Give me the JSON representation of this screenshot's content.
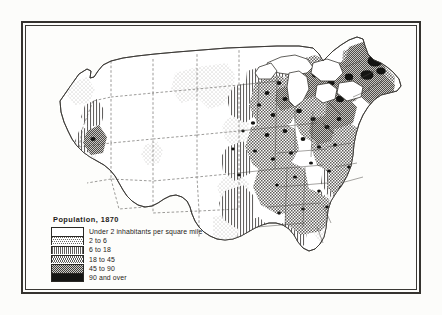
{
  "figure": {
    "kind": "historical-choropleth-map",
    "year": "1870"
  },
  "legend": {
    "title": "Population, 1870",
    "entries": [
      {
        "label": "Under 2 inhabitants per square mile",
        "pattern": "blank-white",
        "color": "#ffffff",
        "min": 0,
        "max": 2
      },
      {
        "label": "2 to 6",
        "pattern": "light-stipple",
        "color": "#ededea",
        "min": 2,
        "max": 6
      },
      {
        "label": "6 to 18",
        "pattern": "vertical-lines",
        "color": "#d8d8d5",
        "min": 6,
        "max": 18
      },
      {
        "label": "18 to 45",
        "pattern": "checker-hatch",
        "color": "#b4b4b1",
        "min": 18,
        "max": 45
      },
      {
        "label": "45 to 90",
        "pattern": "dense-checker",
        "color": "#83837f",
        "min": 45,
        "max": 90
      },
      {
        "label": "90 and over",
        "pattern": "solid-black",
        "color": "#151513",
        "min": 90,
        "max": null
      }
    ]
  },
  "colors": {
    "paper": "#fdfdfb",
    "ink": "#2a2824",
    "frame": "#35332f",
    "coastline": "#3a3834",
    "state_border": "#4a4844"
  },
  "chart_data": {
    "type": "heatmap",
    "title": "Population, 1870",
    "xlabel": "",
    "ylabel": "",
    "units": "inhabitants per square mile",
    "class_breaks": [
      0,
      2,
      6,
      18,
      45,
      90
    ],
    "class_labels": [
      "Under 2 inhabitants per square mile",
      "2 to 6",
      "6 to 18",
      "18 to 45",
      "45 to 90",
      "90 and over"
    ],
    "regions": [
      {
        "name": "Massachusetts / Boston",
        "class": 5
      },
      {
        "name": "New York City area",
        "class": 5
      },
      {
        "name": "Philadelphia area",
        "class": 5
      },
      {
        "name": "Rhode Island",
        "class": 5
      },
      {
        "name": "Connecticut",
        "class": 4
      },
      {
        "name": "New Jersey",
        "class": 4
      },
      {
        "name": "Baltimore area",
        "class": 5
      },
      {
        "name": "Southern New England",
        "class": 4
      },
      {
        "name": "Hudson Valley",
        "class": 4
      },
      {
        "name": "Eastern Pennsylvania",
        "class": 4
      },
      {
        "name": "Ohio",
        "class": 3
      },
      {
        "name": "Indiana",
        "class": 3
      },
      {
        "name": "Illinois",
        "class": 3
      },
      {
        "name": "Chicago",
        "class": 5
      },
      {
        "name": "Cincinnati",
        "class": 5
      },
      {
        "name": "St. Louis",
        "class": 5
      },
      {
        "name": "Kentucky",
        "class": 3
      },
      {
        "name": "Tennessee",
        "class": 3
      },
      {
        "name": "Virginia",
        "class": 3
      },
      {
        "name": "North Carolina",
        "class": 3
      },
      {
        "name": "South Carolina",
        "class": 3
      },
      {
        "name": "Georgia",
        "class": 3
      },
      {
        "name": "Alabama",
        "class": 3
      },
      {
        "name": "Mississippi",
        "class": 2
      },
      {
        "name": "Louisiana",
        "class": 2
      },
      {
        "name": "Eastern Texas",
        "class": 2
      },
      {
        "name": "Western Texas",
        "class": 0
      },
      {
        "name": "Arkansas",
        "class": 2
      },
      {
        "name": "Missouri",
        "class": 3
      },
      {
        "name": "Iowa",
        "class": 3
      },
      {
        "name": "Wisconsin",
        "class": 2
      },
      {
        "name": "Michigan",
        "class": 2
      },
      {
        "name": "Minnesota",
        "class": 1
      },
      {
        "name": "Eastern Kansas",
        "class": 2
      },
      {
        "name": "Eastern Nebraska",
        "class": 1
      },
      {
        "name": "Florida peninsula",
        "class": 0
      },
      {
        "name": "Northern Florida",
        "class": 1
      },
      {
        "name": "Maine interior",
        "class": 1
      },
      {
        "name": "Dakota Territory",
        "class": 0
      },
      {
        "name": "Montana Territory",
        "class": 0
      },
      {
        "name": "Wyoming Territory",
        "class": 0
      },
      {
        "name": "Idaho Territory",
        "class": 0
      },
      {
        "name": "Colorado Territory",
        "class": 0
      },
      {
        "name": "New Mexico Territory",
        "class": 0
      },
      {
        "name": "Arizona Territory",
        "class": 0
      },
      {
        "name": "Utah Territory",
        "class": 0
      },
      {
        "name": "Nevada",
        "class": 0
      },
      {
        "name": "Oregon interior",
        "class": 0
      },
      {
        "name": "Washington Territory",
        "class": 0
      },
      {
        "name": "Willamette Valley, Oregon",
        "class": 2
      },
      {
        "name": "San Francisco Bay",
        "class": 4
      },
      {
        "name": "California Central Valley",
        "class": 2
      },
      {
        "name": "Southern California coast",
        "class": 1
      },
      {
        "name": "Salt Lake City",
        "class": 2
      }
    ]
  }
}
